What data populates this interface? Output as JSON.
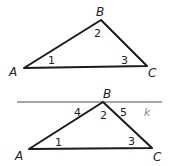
{
  "diagram": {
    "top": {
      "vertices": {
        "A": "A",
        "B": "B",
        "C": "C"
      },
      "angles": {
        "a1": "1",
        "a2": "2",
        "a3": "3"
      }
    },
    "bottom": {
      "vertices": {
        "A": "A",
        "B": "B",
        "C": "C"
      },
      "angles": {
        "a1": "1",
        "a2": "2",
        "a3": "3",
        "a4": "4",
        "a5": "5"
      },
      "line_label": "k"
    },
    "colors": {
      "triangle": "#1a1a1a",
      "line_k": "#888888"
    }
  }
}
